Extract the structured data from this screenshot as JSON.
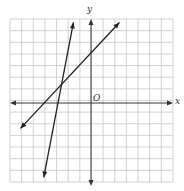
{
  "diagram": {
    "type": "coordinate-plane",
    "grid": {
      "columns": 14,
      "rows": 14,
      "x_range": [
        -7,
        7
      ],
      "y_range": [
        -7,
        7
      ]
    },
    "axis_labels": {
      "x": "x",
      "y": "y",
      "origin": "O"
    },
    "lines": [
      {
        "name": "steep-line",
        "points": [
          [
            -1.55,
            6.7
          ],
          [
            -4.1,
            -6.6
          ]
        ]
      },
      {
        "name": "shallow-line",
        "points": [
          [
            -6.1,
            -2.4
          ],
          [
            2.4,
            6.7
          ]
        ]
      }
    ],
    "intersection_approx": [
      -2.5,
      1.5
    ],
    "colors": {
      "grid": "#c8c8c8",
      "axis": "#333333",
      "line": "#222222"
    }
  }
}
